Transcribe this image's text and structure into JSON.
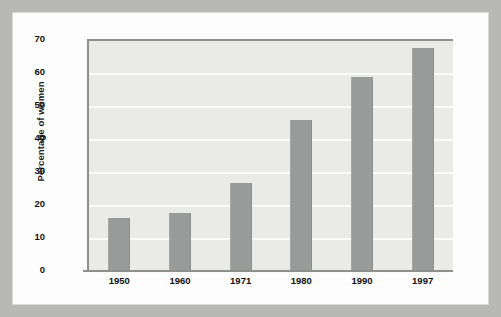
{
  "chart_data": {
    "type": "bar",
    "title": "",
    "subtitle": "",
    "xlabel": "",
    "ylabel": "Percentage of women",
    "categories": [
      "1950",
      "1960",
      "1971",
      "1980",
      "1990",
      "1997"
    ],
    "values": [
      16.5,
      18,
      27,
      46,
      59,
      68
    ],
    "ylim": [
      0,
      70
    ],
    "ytick_labels": [
      "70",
      "60",
      "50",
      "40",
      "30",
      "20",
      "10",
      "0"
    ],
    "ytick_values": [
      70,
      60,
      50,
      40,
      30,
      20,
      10,
      0
    ],
    "grid": true,
    "grid_orientation": "horizontal",
    "legend": false,
    "legend_position": "none",
    "annotations": [],
    "series": [
      {
        "name": "Percentage of women",
        "values": [
          16.5,
          18,
          27,
          46,
          59,
          68
        ]
      }
    ]
  },
  "style": {
    "bar_color": "#999a9a",
    "plot_background": "#eaeae8",
    "gridline_color": "#fbfbfa",
    "axis_color": "#8f8f8e",
    "card_background": "#fdfdfd",
    "mat_background": "#b8b8b7",
    "text_color": "#111111"
  }
}
